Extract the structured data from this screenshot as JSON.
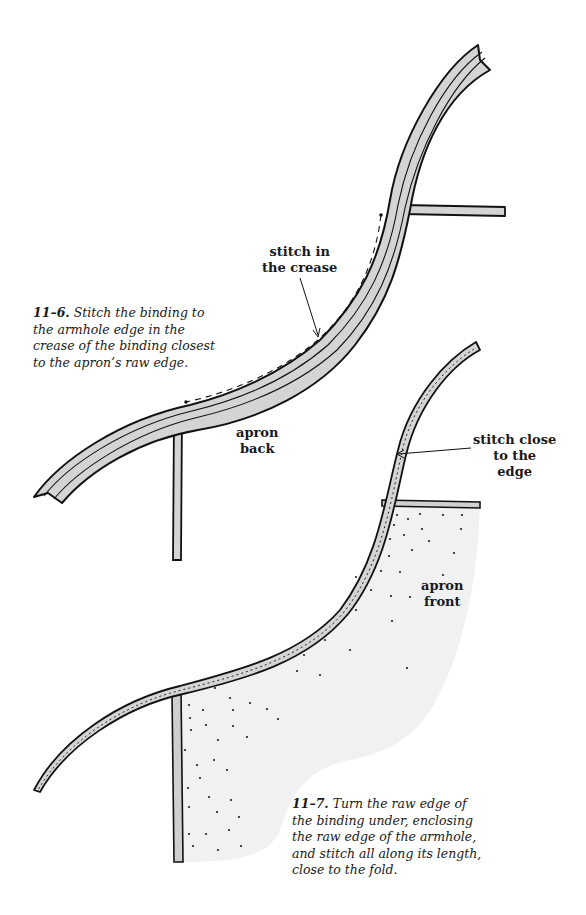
{
  "figure_11_6": {
    "number": "11–6.",
    "caption_lines": [
      "Stitch the binding to",
      "the armhole edge in the",
      "crease of the binding closest",
      "to the apron’s raw edge."
    ],
    "callout_stitch_crease": [
      "stitch in",
      "the crease"
    ],
    "label_apron_back": [
      "apron",
      "back"
    ]
  },
  "figure_11_7": {
    "number": "11–7.",
    "caption_lines": [
      "Turn the raw edge of",
      "the binding under, enclosing",
      "the raw edge of the armhole,",
      "and stitch all along its length,",
      "close to the fold."
    ],
    "callout_stitch_edge": [
      "stitch close",
      "to the",
      "edge"
    ],
    "label_apron_front": [
      "apron",
      "front"
    ]
  },
  "colors": {
    "binding_fill": "#d4d4d4",
    "outline": "#111111",
    "fabric_fill": "#f1f1f1",
    "background": "#ffffff"
  }
}
